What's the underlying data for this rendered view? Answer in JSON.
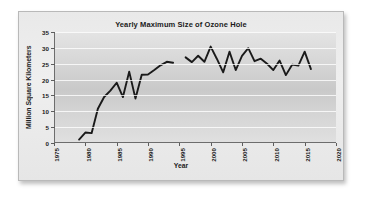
{
  "figure": {
    "title": "Yearly Maximum Size of Ozone Hole",
    "x_axis_title": "Year",
    "y_axis_title": "Million Square Kilometers"
  },
  "chart_data": {
    "type": "line",
    "title": "Yearly Maximum Size of Ozone Hole",
    "xlabel": "Year",
    "ylabel": "Million Square Kilometers",
    "xlim": [
      1975,
      2020
    ],
    "ylim": [
      0,
      35
    ],
    "xticks": [
      1975,
      1980,
      1985,
      1990,
      1995,
      2000,
      2005,
      2010,
      2015,
      2020
    ],
    "yticks": [
      0,
      5,
      10,
      15,
      20,
      25,
      30,
      35
    ],
    "grid": "horizontal",
    "legend": "none",
    "line_color": "#1a1a1a",
    "gap_years": [
      1995
    ],
    "x": [
      1979,
      1980,
      1981,
      1982,
      1983,
      1984,
      1985,
      1986,
      1987,
      1988,
      1989,
      1990,
      1991,
      1992,
      1993,
      1994,
      1996,
      1997,
      1998,
      1999,
      2000,
      2001,
      2002,
      2003,
      2004,
      2005,
      2006,
      2007,
      2008,
      2009,
      2010,
      2011,
      2012,
      2013,
      2014,
      2015,
      2016
    ],
    "y": [
      1.1,
      3.3,
      3.1,
      10.8,
      14.5,
      16.5,
      19.0,
      14.5,
      22.5,
      14.0,
      21.5,
      21.6,
      23.0,
      24.5,
      25.6,
      25.3,
      27.0,
      25.5,
      27.5,
      25.6,
      30.4,
      26.5,
      22.3,
      28.8,
      23.0,
      27.5,
      29.9,
      25.8,
      26.6,
      25.0,
      23.0,
      26.0,
      21.4,
      24.7,
      24.4,
      28.8,
      23.3
    ],
    "series_name": "Ozone hole maximum area"
  }
}
